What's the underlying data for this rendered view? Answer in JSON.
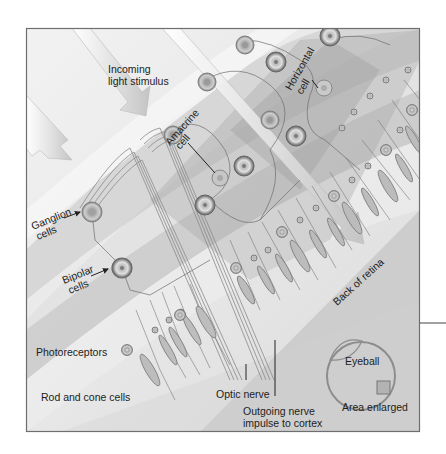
{
  "figure": {
    "colors": {
      "background": "#ffffff",
      "frame_border": "#6e6e6e",
      "light_band": "#e6e6e6",
      "mid_band": "#c9c9c9",
      "dark_band": "#a9a9a9",
      "cell_ring": "#8a8a8a",
      "cell_fill": "#bdbdbd",
      "text": "#222222"
    }
  },
  "labels": {
    "incoming_light_line1": "Incoming",
    "incoming_light_line2": "light stimulus",
    "ganglion_line1": "Ganglion",
    "ganglion_line2": "cells",
    "bipolar_line1": "Bipolar",
    "bipolar_line2": "cells",
    "amacrine_line1": "Amacrine",
    "amacrine_line2": "cell",
    "horizontal_line1": "Horizontal",
    "horizontal_line2": "cell",
    "photoreceptors": "Photoreceptors",
    "rod_cone": "Rod and cone cells",
    "optic_nerve": "Optic nerve",
    "outgoing_line1": "Outgoing nerve",
    "outgoing_line2": "impulse to cortex",
    "back_of_retina": "Back of retina",
    "eyeball": "Eyeball",
    "area_enlarged": "Area enlarged"
  }
}
